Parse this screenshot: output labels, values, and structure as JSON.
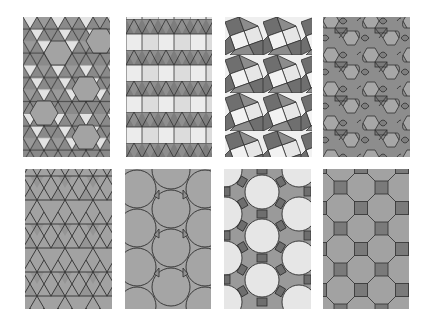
{
  "figure": {
    "background": "#ffffff",
    "line_color": "#2e2e2e",
    "colors": {
      "light": "#e4e4e4",
      "mid": "#a6a6a6",
      "dark": "#7c7c7c",
      "grey_fill": "#9e9e9e"
    }
  },
  "panels": [
    {
      "id": "p1",
      "row": 1,
      "col": 1,
      "name": "snub-hexagonal-tiling",
      "label": "Snub hexagonal (3.3.3.3.6)",
      "x": 23,
      "y": 17,
      "w": 87,
      "h": 140
    },
    {
      "id": "p2",
      "row": 1,
      "col": 2,
      "name": "elongated-triangular-tiling",
      "label": "Elongated triangular (3.3.3.4.4)",
      "x": 126,
      "y": 17,
      "w": 86,
      "h": 140
    },
    {
      "id": "p3",
      "row": 1,
      "col": 3,
      "name": "snub-square-tiling",
      "label": "Snub square (3.3.4.3.4)",
      "x": 225,
      "y": 17,
      "w": 87,
      "h": 140
    },
    {
      "id": "p4",
      "row": 1,
      "col": 4,
      "name": "rhombitrihexagonal-tiling",
      "label": "Rhombitrihexagonal (3.4.6.4)",
      "x": 323,
      "y": 17,
      "w": 87,
      "h": 140
    },
    {
      "id": "p5",
      "row": 2,
      "col": 1,
      "name": "trihexagonal-tiling",
      "label": "Trihexagonal (3.6.3.6)",
      "x": 25,
      "y": 169,
      "w": 87,
      "h": 140
    },
    {
      "id": "p6",
      "row": 2,
      "col": 2,
      "name": "truncated-hexagonal-tiling",
      "label": "Truncated hexagonal (3.12.12)",
      "x": 125,
      "y": 169,
      "w": 86,
      "h": 140
    },
    {
      "id": "p7",
      "row": 2,
      "col": 3,
      "name": "truncated-trihexagonal-tiling",
      "label": "Truncated trihexagonal (4.6.12)",
      "x": 224,
      "y": 169,
      "w": 87,
      "h": 140
    },
    {
      "id": "p8",
      "row": 2,
      "col": 4,
      "name": "truncated-square-tiling",
      "label": "Truncated square (4.8.8)",
      "x": 323,
      "y": 169,
      "w": 86,
      "h": 140
    }
  ]
}
